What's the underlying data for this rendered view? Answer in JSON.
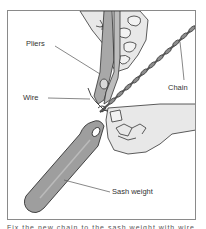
{
  "figure": {
    "labels": {
      "pliers": "Pliers",
      "wire": "Wire",
      "chain": "Chain",
      "sash_weight": "Sash weight"
    },
    "caption": "Fix the new chain to the sash weight with wire",
    "colors": {
      "frame": "#8a8a8a",
      "line": "#333333",
      "skin": "#e6e6e6",
      "weight": "#9e9e9e",
      "pliers": "#a8a8a8",
      "chain": "#7a7a7a",
      "background": "#ffffff"
    }
  }
}
